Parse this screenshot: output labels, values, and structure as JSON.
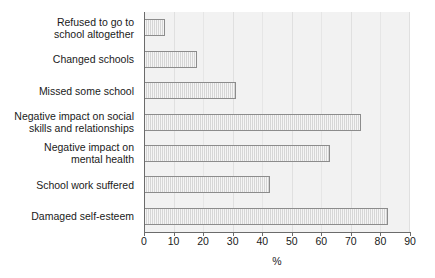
{
  "chart_data": {
    "type": "bar",
    "orientation": "horizontal",
    "title": "",
    "xlabel": "%",
    "ylabel": "",
    "xlim": [
      0,
      90
    ],
    "xticks": [
      0,
      10,
      20,
      30,
      40,
      50,
      60,
      70,
      80,
      90
    ],
    "grid": true,
    "legend": false,
    "categories": [
      "Refused to go to school altogether",
      "Changed schools",
      "Missed some school",
      "Negative impact on social skills and relationships",
      "Negative impact on mental health",
      "School work suffered",
      "Damaged self-esteem"
    ],
    "category_label_lines": [
      [
        "Refused to go to",
        "school altogether"
      ],
      [
        "Changed schools"
      ],
      [
        "Missed some school"
      ],
      [
        "Negative impact on social",
        "skills and relationships"
      ],
      [
        "Negative impact on",
        "mental health"
      ],
      [
        "School work suffered"
      ],
      [
        "Damaged self-esteem"
      ]
    ],
    "values": [
      7,
      18,
      31,
      73.5,
      63,
      42.5,
      82.5
    ],
    "bar_fill_color": "#d6d6d6",
    "bar_border_color": "#8c8c8c",
    "plot_background_color": "#f2f2f2",
    "axis_color": "#6b6b6b",
    "text_color": "#1a1a1a"
  },
  "axis": {
    "x_tick_labels": [
      "0",
      "10",
      "20",
      "30",
      "40",
      "50",
      "60",
      "70",
      "80",
      "90"
    ],
    "x_title": "%"
  }
}
